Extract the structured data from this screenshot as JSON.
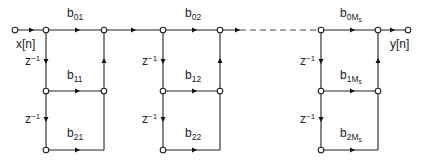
{
  "diagram": {
    "type": "signal-flow-graph",
    "input_label": "x[n]",
    "output_label": "y[n]",
    "delay_label": {
      "base": "z",
      "exp": "−1"
    },
    "sections": [
      {
        "coefficients": [
          {
            "base": "b",
            "sub": "01"
          },
          {
            "base": "b",
            "sub": "11"
          },
          {
            "base": "b",
            "sub": "21"
          }
        ]
      },
      {
        "coefficients": [
          {
            "base": "b",
            "sub": "02"
          },
          {
            "base": "b",
            "sub": "12"
          },
          {
            "base": "b",
            "sub": "22"
          }
        ]
      },
      {
        "coefficients": [
          {
            "base": "b",
            "sub": "0M",
            "subsub": "s"
          },
          {
            "base": "b",
            "sub": "1M",
            "subsub": "s"
          },
          {
            "base": "b",
            "sub": "2M",
            "subsub": "s"
          }
        ]
      }
    ]
  }
}
